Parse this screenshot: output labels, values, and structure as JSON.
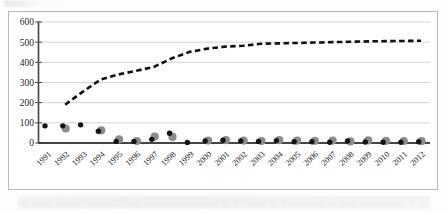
{
  "figure": {
    "name": "scanned-line-scatter-figure",
    "border_color": "#b9b9b9",
    "background": "#ffffff"
  },
  "chart_data": {
    "type": "line",
    "title": "",
    "subtitle": "",
    "xlabel": "",
    "ylabel": "",
    "grid": true,
    "legend": "none",
    "xlim": [
      1991,
      2012
    ],
    "ylim": [
      0,
      600
    ],
    "yticks": [
      0,
      100,
      200,
      300,
      400,
      500,
      600
    ],
    "ytick_labels": [
      "0",
      "100",
      "200",
      "300",
      "400",
      "500",
      "600"
    ],
    "categories": [
      "1991",
      "1992",
      "1993",
      "1994",
      "1995",
      "1996",
      "1997",
      "1998",
      "1999",
      "2000",
      "2001",
      "2002",
      "2003",
      "2004",
      "2005",
      "2006",
      "2007",
      "2008",
      "2009",
      "2010",
      "2011",
      "2012"
    ],
    "series": [
      {
        "name": "cumulative-dashed-line",
        "style": "dashed",
        "marker": "none",
        "color": "#111111",
        "values": [
          null,
          190,
          255,
          315,
          340,
          358,
          378,
          420,
          452,
          468,
          478,
          482,
          492,
          494,
          496,
          498,
          500,
          502,
          504,
          505,
          506,
          507
        ]
      },
      {
        "name": "black-dots-series",
        "style": "scatter",
        "marker": "circle-small",
        "color": "#141414",
        "values": [
          85,
          85,
          90,
          58,
          8,
          8,
          18,
          48,
          3,
          10,
          14,
          10,
          8,
          12,
          6,
          6,
          4,
          10,
          5,
          4,
          4,
          6
        ]
      },
      {
        "name": "gray-dots-series",
        "style": "scatter",
        "marker": "circle-large",
        "color": "#8c8c8c",
        "values": [
          null,
          72,
          null,
          63,
          18,
          10,
          32,
          30,
          null,
          12,
          14,
          12,
          10,
          14,
          12,
          11,
          12,
          8,
          13,
          11,
          10,
          9
        ]
      }
    ]
  }
}
